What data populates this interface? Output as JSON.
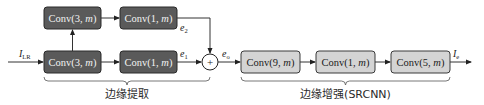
{
  "diagram": {
    "edge_extraction": {
      "branch_top": [
        {
          "label": "Conv(3, ",
          "param": "m",
          "close": ")"
        },
        {
          "label": "Conv(1, ",
          "param": "m",
          "close": ")"
        }
      ],
      "branch_bottom": [
        {
          "label": "Conv(3, ",
          "param": "m",
          "close": ")"
        },
        {
          "label": "Conv(1, ",
          "param": "m",
          "close": ")"
        }
      ],
      "output_top": {
        "symbol": "e",
        "sub": "2"
      },
      "output_bottom": {
        "symbol": "e",
        "sub": "1"
      },
      "group_label": "边缘提取"
    },
    "input": {
      "symbol": "I",
      "sub": "LR"
    },
    "sum_node": {
      "symbol": "+"
    },
    "sum_output": {
      "symbol": "e",
      "sub": "o"
    },
    "edge_enhancement": {
      "layers": [
        {
          "label": "Conv(9, ",
          "param": "m",
          "close": ")"
        },
        {
          "label": "Conv(1, ",
          "param": "m",
          "close": ")"
        },
        {
          "label": "Conv(5, ",
          "param": "m",
          "close": ")"
        }
      ],
      "group_label": "边缘增强(SRCNN)"
    },
    "output": {
      "symbol": "I",
      "sub": "e"
    },
    "colors": {
      "extraction_box": "#5a5a5a",
      "enhancement_box": "#d4d4d4"
    }
  }
}
